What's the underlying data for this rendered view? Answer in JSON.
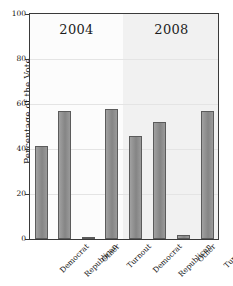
{
  "chart_data": {
    "type": "bar",
    "title": "",
    "xlabel": "",
    "ylabel": "Percentage of the Vote",
    "ylim": [
      0,
      100
    ],
    "yticks": [
      0,
      20,
      40,
      60,
      80,
      100
    ],
    "grid": true,
    "legend": "none",
    "panels": [
      {
        "label": "2004",
        "categories": [
          "Democrat",
          "Republican",
          "Other",
          "Turnout"
        ],
        "values": [
          41.5,
          57.0,
          1.0,
          58.0
        ]
      },
      {
        "label": "2008",
        "categories": [
          "Democrat",
          "Republican",
          "Other",
          "Turnout"
        ],
        "values": [
          46.0,
          52.0,
          2.0,
          57.0
        ]
      }
    ],
    "bar_color": "#8c8c8c",
    "bar_edge_color": "#5b5b5b",
    "axis_color": "#3a3a3a",
    "grid_color": "#e4e4e4",
    "panel_bg_left": "#fcfcfc",
    "panel_bg_right": "#f1f1f1"
  }
}
